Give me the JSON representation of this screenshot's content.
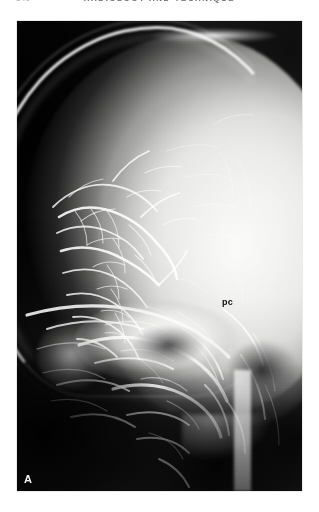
{
  "page": {
    "folio": "340",
    "running_title": "RADIOLOGY AND TECHNIQUE",
    "background_color": "#ffffff"
  },
  "figure": {
    "panel_label": "A",
    "kind": "lateral-skull-radiograph",
    "annotations": [
      {
        "id": "pc",
        "label": "pc",
        "meaning": "posterior cerebral artery",
        "color": "#101010"
      }
    ],
    "plate": {
      "film_background_color": "#0b0b0b",
      "bone_highlight_color": "#ffffff",
      "parenchyma_color": "#f6f6f4"
    }
  }
}
